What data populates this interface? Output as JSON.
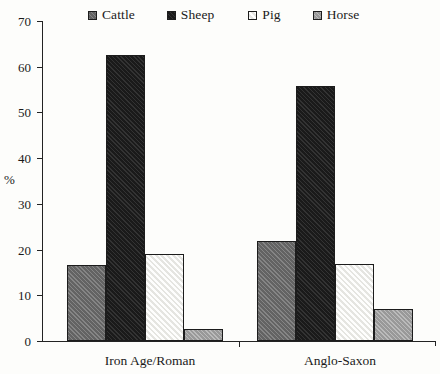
{
  "chart_data": {
    "type": "bar",
    "title": "",
    "subtitle": "",
    "xlabel": "",
    "ylabel": "%",
    "categories": [
      "Iron Age/Roman",
      "Anglo-Saxon"
    ],
    "series": [
      {
        "name": "Cattle",
        "values": [
          16.7,
          21.8
        ],
        "color": "#6e6e6e"
      },
      {
        "name": "Sheep",
        "values": [
          62.5,
          55.7
        ],
        "color": "#232323"
      },
      {
        "name": "Pig",
        "values": [
          19.0,
          16.9
        ],
        "color": "#f2f2ee"
      },
      {
        "name": "Horse",
        "values": [
          2.6,
          6.9
        ],
        "color": "#a8a8a8"
      }
    ],
    "ylim": [
      0,
      70
    ],
    "yticks": [
      0,
      10,
      20,
      30,
      40,
      50,
      60,
      70
    ],
    "ytick_labels": [
      "0",
      "10",
      "20",
      "30",
      "40",
      "50",
      "60",
      "70"
    ],
    "grid": false,
    "legend_position": "top"
  },
  "legend": {
    "items": [
      {
        "label": "Cattle",
        "swatch": "legend-swatch-cattle"
      },
      {
        "label": "Sheep",
        "swatch": "legend-swatch-sheep"
      },
      {
        "label": "Pig",
        "swatch": "legend-swatch-pig"
      },
      {
        "label": "Horse",
        "swatch": "legend-swatch-horse"
      }
    ]
  },
  "axes": {
    "y_title": "%",
    "y_labels": [
      "70",
      "60",
      "50",
      "40",
      "30",
      "20",
      "10",
      "0"
    ],
    "x_labels": [
      "Iron Age/Roman",
      "Anglo-Saxon"
    ]
  },
  "colors": {
    "background": "#fdfdfb",
    "axis": "#232323",
    "text": "#1a1a1a",
    "cattle": "#6e6e6e",
    "sheep": "#232323",
    "pig": "#f2f2ee",
    "horse": "#a8a8a8"
  }
}
